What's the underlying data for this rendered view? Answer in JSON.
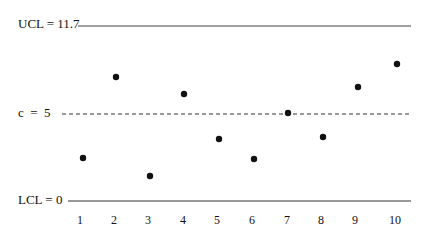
{
  "chart_data": {
    "type": "scatter",
    "title": "",
    "subtitle": "c control chart",
    "xlabel": "",
    "ylabel": "",
    "x": [
      1,
      2,
      3,
      4,
      5,
      6,
      7,
      8,
      9,
      10
    ],
    "categories": [
      "1",
      "2",
      "3",
      "4",
      "5",
      "6",
      "7",
      "8",
      "9",
      "10"
    ],
    "series": [
      {
        "name": "defects (c)",
        "values": [
          3,
          8,
          2,
          7,
          4,
          3,
          5,
          4,
          7.5,
          9
        ]
      }
    ],
    "control_lines": {
      "ucl": {
        "label": "UCL = 11.7",
        "value": 11.7,
        "style": "solid"
      },
      "center": {
        "label": "c  =  5",
        "value": 5,
        "style": "dashed"
      },
      "lcl": {
        "label": "LCL = 0",
        "value": 0,
        "style": "solid"
      }
    },
    "ylim": [
      0,
      11.7
    ],
    "grid": false,
    "legend": "none",
    "point_pixels": [
      [
        83,
        158
      ],
      [
        116,
        77
      ],
      [
        150,
        176
      ],
      [
        184,
        94
      ],
      [
        219,
        139
      ],
      [
        254,
        159
      ],
      [
        288,
        113
      ],
      [
        323,
        137
      ],
      [
        358,
        87
      ],
      [
        397,
        64
      ]
    ],
    "xtick_pixels": [
      80,
      114,
      148,
      183,
      217,
      252,
      287,
      321,
      355,
      395
    ]
  },
  "labels": {
    "ucl": "UCL = 11.7",
    "center": "c  =  5",
    "lcl": "LCL = 0",
    "xticks": [
      "1",
      "2",
      "3",
      "4",
      "5",
      "6",
      "7",
      "8",
      "9",
      "10"
    ]
  },
  "colors": {
    "ink": "#111111",
    "line": "#333333"
  }
}
